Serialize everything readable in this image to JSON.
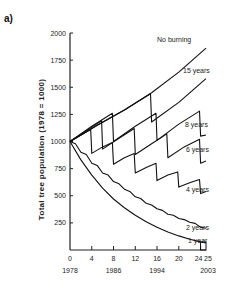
{
  "panel_label": "a)",
  "chart_data": {
    "type": "line",
    "title": "",
    "xlabel": "",
    "ylabel": "Total tree population (1978 = 1000)",
    "xlim": [
      0,
      25
    ],
    "ylim": [
      0,
      2000
    ],
    "x_ticks": [
      0,
      4,
      8,
      12,
      16,
      20,
      24,
      25
    ],
    "x_tick_labels": [
      "0",
      "4",
      "8",
      "12",
      "16",
      "20",
      "24",
      "25"
    ],
    "x_secondary_labels": [
      {
        "x": 0,
        "label": "1978"
      },
      {
        "x": 8,
        "label": "1986"
      },
      {
        "x": 16,
        "label": "1994"
      },
      {
        "x": 25,
        "label": "2003"
      }
    ],
    "y_ticks": [
      250,
      500,
      750,
      1000,
      1250,
      1500,
      1750,
      2000
    ],
    "y_tick_labels": [
      "250",
      "500",
      "750",
      "1000",
      "1250",
      "1500",
      "1750",
      "2000"
    ],
    "grid": false,
    "legend": "inline labels at right end of each series",
    "series": [
      {
        "name": "No burning",
        "points": [
          [
            0,
            1000
          ],
          [
            5,
            1150
          ],
          [
            10,
            1290
          ],
          [
            15,
            1450
          ],
          [
            20,
            1640
          ],
          [
            25,
            1860
          ]
        ]
      },
      {
        "name": "15 years",
        "points": [
          [
            0,
            1000
          ],
          [
            5,
            1150
          ],
          [
            10,
            1290
          ],
          [
            14.8,
            1440
          ],
          [
            15,
            1180
          ],
          [
            20,
            1360
          ],
          [
            25,
            1580
          ]
        ]
      },
      {
        "name": "8 years",
        "points": [
          [
            0,
            1000
          ],
          [
            4,
            1140
          ],
          [
            7.8,
            1260
          ],
          [
            8,
            1000
          ],
          [
            12,
            1140
          ],
          [
            15.8,
            1260
          ],
          [
            16,
            1010
          ],
          [
            20,
            1160
          ],
          [
            23.8,
            1280
          ],
          [
            24,
            1050
          ],
          [
            25,
            1060
          ]
        ]
      },
      {
        "name": "6 years",
        "points": [
          [
            0,
            1000
          ],
          [
            3,
            1100
          ],
          [
            5.8,
            1190
          ],
          [
            6,
            930
          ],
          [
            9,
            1030
          ],
          [
            11.8,
            1120
          ],
          [
            12,
            880
          ],
          [
            15,
            980
          ],
          [
            17.8,
            1070
          ],
          [
            18,
            850
          ],
          [
            21,
            950
          ],
          [
            23.8,
            1020
          ],
          [
            24,
            800
          ],
          [
            25,
            820
          ]
        ]
      },
      {
        "name": "4 years",
        "points": [
          [
            0,
            1000
          ],
          [
            2,
            1060
          ],
          [
            3.8,
            1110
          ],
          [
            4,
            890
          ],
          [
            6,
            950
          ],
          [
            7.8,
            990
          ],
          [
            8,
            790
          ],
          [
            10,
            850
          ],
          [
            11.8,
            890
          ],
          [
            12,
            710
          ],
          [
            14,
            760
          ],
          [
            15.8,
            800
          ],
          [
            16,
            640
          ],
          [
            18,
            690
          ],
          [
            19.8,
            720
          ],
          [
            20,
            580
          ],
          [
            22,
            620
          ],
          [
            23.8,
            650
          ],
          [
            24,
            520
          ],
          [
            25,
            540
          ]
        ]
      },
      {
        "name": "2 years",
        "points": [
          [
            0,
            1000
          ],
          [
            1,
            980
          ],
          [
            2,
            900
          ],
          [
            3,
            880
          ],
          [
            4,
            800
          ],
          [
            5,
            780
          ],
          [
            6,
            710
          ],
          [
            7,
            690
          ],
          [
            8,
            630
          ],
          [
            9,
            610
          ],
          [
            10,
            560
          ],
          [
            11,
            540
          ],
          [
            12,
            490
          ],
          [
            13,
            475
          ],
          [
            14,
            430
          ],
          [
            15,
            415
          ],
          [
            16,
            380
          ],
          [
            17,
            365
          ],
          [
            18,
            330
          ],
          [
            19,
            320
          ],
          [
            20,
            290
          ],
          [
            21,
            280
          ],
          [
            22,
            255
          ],
          [
            23,
            245
          ],
          [
            24,
            210
          ],
          [
            25,
            200
          ]
        ]
      },
      {
        "name": "1 year",
        "points": [
          [
            0,
            1000
          ],
          [
            2,
            830
          ],
          [
            4,
            690
          ],
          [
            6,
            570
          ],
          [
            8,
            470
          ],
          [
            10,
            390
          ],
          [
            12,
            320
          ],
          [
            14,
            260
          ],
          [
            16,
            210
          ],
          [
            18,
            165
          ],
          [
            20,
            130
          ],
          [
            22,
            100
          ],
          [
            24,
            75
          ],
          [
            25,
            65
          ]
        ]
      }
    ]
  }
}
